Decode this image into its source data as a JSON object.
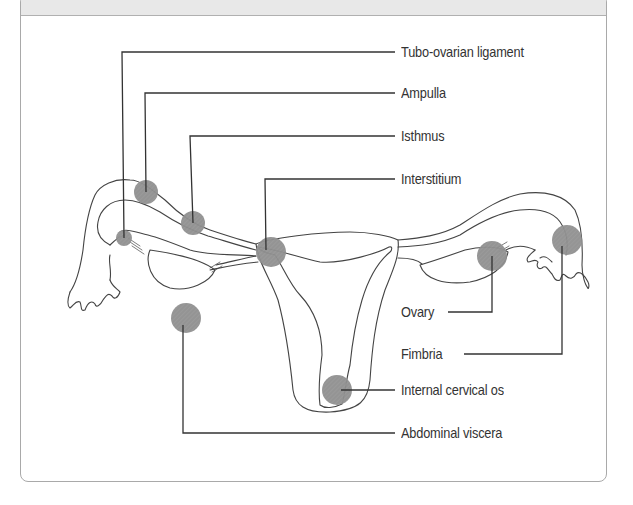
{
  "diagram": {
    "type": "anatomical-labeled-diagram",
    "marker_color": "#8c8c8c",
    "line_color": "#333333",
    "labels": [
      {
        "id": "tubo-ovarian-ligament",
        "text": "Tubo-ovarian ligament",
        "x": 401,
        "y": 40
      },
      {
        "id": "ampulla",
        "text": "Ampulla",
        "x": 401,
        "y": 82
      },
      {
        "id": "isthmus",
        "text": "Isthmus",
        "x": 401,
        "y": 125
      },
      {
        "id": "interstitium",
        "text": "Interstitium",
        "x": 401,
        "y": 168
      },
      {
        "id": "ovary",
        "text": "Ovary",
        "x": 401,
        "y": 301
      },
      {
        "id": "fimbria",
        "text": "Fimbria",
        "x": 401,
        "y": 342
      },
      {
        "id": "internal-cervical-os",
        "text": "Internal cervical os",
        "x": 401,
        "y": 385
      },
      {
        "id": "abdominal-viscera",
        "text": "Abdominal viscera",
        "x": 401,
        "y": 427
      }
    ]
  }
}
